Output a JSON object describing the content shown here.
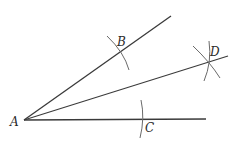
{
  "diagram": {
    "colors": {
      "line": "#3a3a3a",
      "arc": "#6a6a6a",
      "label": "#2a2a2a"
    },
    "points": {
      "A": {
        "label": "A",
        "x": 24,
        "y": 120
      },
      "B": {
        "label": "B",
        "x": 120,
        "y": 53
      },
      "C": {
        "label": "C",
        "x": 142,
        "y": 120
      },
      "D": {
        "label": "D",
        "x": 208,
        "y": 62
      }
    },
    "rays": [
      {
        "name": "ray-AB",
        "from": "A",
        "to": [
          171,
          16
        ]
      },
      {
        "name": "ray-AD",
        "from": "A",
        "to": [
          228,
          56
        ]
      },
      {
        "name": "ray-AC",
        "from": "A",
        "to": [
          206,
          119
        ]
      }
    ]
  }
}
